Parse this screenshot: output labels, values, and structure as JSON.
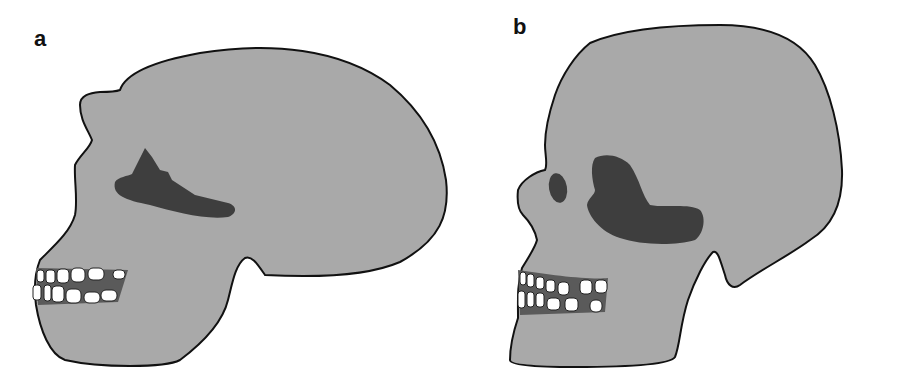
{
  "figure": {
    "panels": [
      {
        "label": "a",
        "subject": "skull-lateral-view-archaic"
      },
      {
        "label": "b",
        "subject": "skull-lateral-view-modern"
      }
    ],
    "colors": {
      "bone": "#a9a9a9",
      "outline": "#111111",
      "orbit": "#3e3e3e",
      "teeth": "#ffffff",
      "gum": "#5a5a5a",
      "background": "#ffffff"
    }
  }
}
